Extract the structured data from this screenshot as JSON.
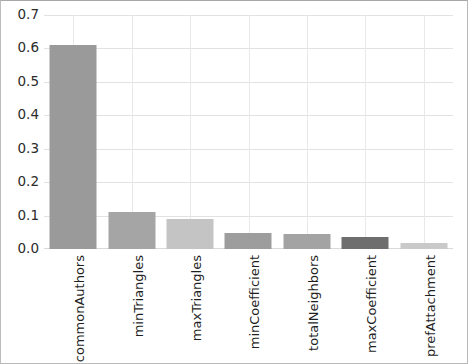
{
  "chart_data": {
    "type": "bar",
    "title": "",
    "subtitle": "",
    "xlabel": "",
    "ylabel": "",
    "categories": [
      "commonAuthors",
      "minTriangles",
      "maxTriangles",
      "minCoefficient",
      "totalNeighbors",
      "maxCoefficient",
      "prefAttachment"
    ],
    "values": [
      0.61,
      0.11,
      0.09,
      0.048,
      0.044,
      0.035,
      0.017
    ],
    "bar_colors": [
      "#9a9a9a",
      "#a5a5a5",
      "#c4c4c4",
      "#9d9d9d",
      "#a3a3a3",
      "#6e6e6e",
      "#c9c9c9"
    ],
    "ylim": [
      0.0,
      0.7
    ],
    "ytick_labels": [
      "0.0",
      "0.1",
      "0.2",
      "0.3",
      "0.4",
      "0.5",
      "0.6",
      "0.7"
    ],
    "ytick_values": [
      0.0,
      0.1,
      0.2,
      0.3,
      0.4,
      0.5,
      0.6,
      0.7
    ],
    "grid": {
      "horizontal": true,
      "vertical": true,
      "color": "#e2e2e2"
    },
    "legend": {
      "visible": false,
      "position": "none",
      "entries": []
    },
    "annotations": [],
    "xtick_rotation": -90,
    "frame_color": "#b9b9b9"
  }
}
